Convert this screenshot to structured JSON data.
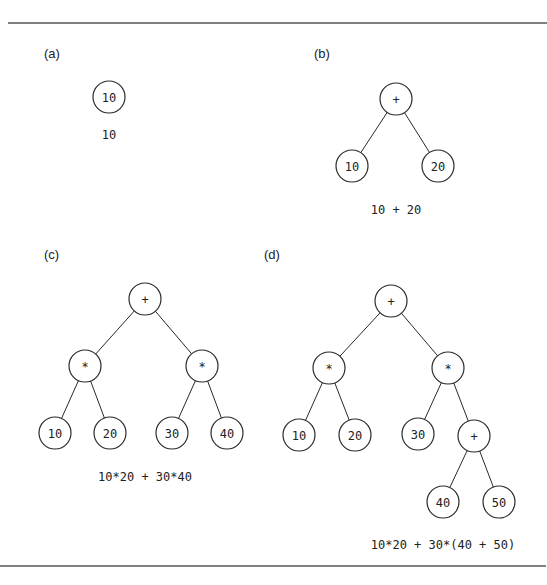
{
  "figure": {
    "panels": [
      {
        "id": "a",
        "label": "(a)",
        "label_pos": [
          44,
          58
        ],
        "nodes": [
          {
            "id": "n1",
            "text": "10",
            "x": 109,
            "y": 97
          }
        ],
        "edges": [],
        "caption": "10",
        "caption_pos": [
          109,
          139
        ]
      },
      {
        "id": "b",
        "label": "(b)",
        "label_pos": [
          314,
          58
        ],
        "nodes": [
          {
            "id": "n1",
            "text": "+",
            "x": 396,
            "y": 99
          },
          {
            "id": "n2",
            "text": "10",
            "x": 352,
            "y": 166
          },
          {
            "id": "n3",
            "text": "20",
            "x": 438,
            "y": 166
          }
        ],
        "edges": [
          [
            "n1",
            "n2"
          ],
          [
            "n1",
            "n3"
          ]
        ],
        "caption": "10 + 20",
        "caption_pos": [
          396,
          214
        ]
      },
      {
        "id": "c",
        "label": "(c)",
        "label_pos": [
          44,
          259
        ],
        "nodes": [
          {
            "id": "n1",
            "text": "+",
            "x": 145,
            "y": 299
          },
          {
            "id": "n2",
            "text": "*",
            "x": 85,
            "y": 366
          },
          {
            "id": "n3",
            "text": "*",
            "x": 202,
            "y": 366
          },
          {
            "id": "n4",
            "text": "10",
            "x": 55,
            "y": 433
          },
          {
            "id": "n5",
            "text": "20",
            "x": 110,
            "y": 433
          },
          {
            "id": "n6",
            "text": "30",
            "x": 172,
            "y": 433
          },
          {
            "id": "n7",
            "text": "40",
            "x": 227,
            "y": 433
          }
        ],
        "edges": [
          [
            "n1",
            "n2"
          ],
          [
            "n1",
            "n3"
          ],
          [
            "n2",
            "n4"
          ],
          [
            "n2",
            "n5"
          ],
          [
            "n3",
            "n6"
          ],
          [
            "n3",
            "n7"
          ]
        ],
        "caption": "10*20 + 30*40",
        "caption_pos": [
          145,
          481
        ]
      },
      {
        "id": "d",
        "label": "(d)",
        "label_pos": [
          264,
          259
        ],
        "nodes": [
          {
            "id": "n1",
            "text": "+",
            "x": 391,
            "y": 301
          },
          {
            "id": "n2",
            "text": "*",
            "x": 329,
            "y": 368
          },
          {
            "id": "n3",
            "text": "*",
            "x": 448,
            "y": 368
          },
          {
            "id": "n4",
            "text": "10",
            "x": 299,
            "y": 435
          },
          {
            "id": "n5",
            "text": "20",
            "x": 355,
            "y": 435
          },
          {
            "id": "n6",
            "text": "30",
            "x": 418,
            "y": 434
          },
          {
            "id": "n7",
            "text": "+",
            "x": 474,
            "y": 436
          },
          {
            "id": "n8",
            "text": "40",
            "x": 443,
            "y": 502
          },
          {
            "id": "n9",
            "text": "50",
            "x": 499,
            "y": 502
          }
        ],
        "edges": [
          [
            "n1",
            "n2"
          ],
          [
            "n1",
            "n3"
          ],
          [
            "n2",
            "n4"
          ],
          [
            "n2",
            "n5"
          ],
          [
            "n3",
            "n6"
          ],
          [
            "n3",
            "n7"
          ],
          [
            "n7",
            "n8"
          ],
          [
            "n7",
            "n9"
          ]
        ],
        "caption": "10*20 + 30*(40 + 50)",
        "caption_pos": [
          443,
          549
        ]
      }
    ],
    "node_radius": 16,
    "colors": {
      "stroke": "#2a2a2a",
      "text": "#222222",
      "background": "#ffffff",
      "rule": "#555555"
    },
    "rules": {
      "top": {
        "x1": 8,
        "x2": 547,
        "y": 23
      },
      "bottom": {
        "x1": 0,
        "x2": 546,
        "y": 566
      }
    }
  }
}
